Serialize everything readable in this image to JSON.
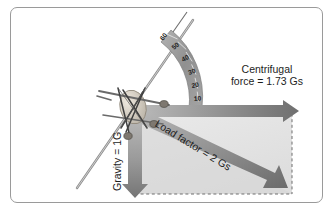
{
  "figure": {
    "background_color": "#ffffff",
    "frame_border_color": "#9a9a9a"
  },
  "labels": {
    "centrifugal_line1": "Centrifugal",
    "centrifugal_line2": "force = 1.73 Gs",
    "gravity": "Gravity = 1G",
    "load_factor": "Load factor = 2 Gs"
  },
  "vectors": [
    {
      "name": "centrifugal-force",
      "label": "Centrifugal force = 1.73 Gs",
      "magnitude": 1.73,
      "unit": "Gs",
      "direction": "horizontal-right",
      "color": "#8d8d8d"
    },
    {
      "name": "gravity",
      "label": "Gravity = 1G",
      "magnitude": 1,
      "unit": "G",
      "direction": "vertical-down",
      "color": "#8d8d8d"
    },
    {
      "name": "load-factor",
      "label": "Load factor = 2 Gs",
      "magnitude": 2,
      "unit": "Gs",
      "direction": "diagonal-down-right",
      "color": "#8d8d8d"
    }
  ],
  "bank_scale": {
    "name": "bank-angle-protractor",
    "unit": "degrees",
    "ticks": [
      "60",
      "50",
      "40",
      "30",
      "20",
      "10"
    ],
    "band_color": "#9c9c9c"
  },
  "construction": {
    "dashed_rectangle_color": "#7a7a7a",
    "shaded_region_color": "#dcdcdc"
  },
  "aircraft": {
    "name": "banked-aircraft-model",
    "body_color": "#cfc9bf",
    "strut_color": "#4a4a4a"
  }
}
